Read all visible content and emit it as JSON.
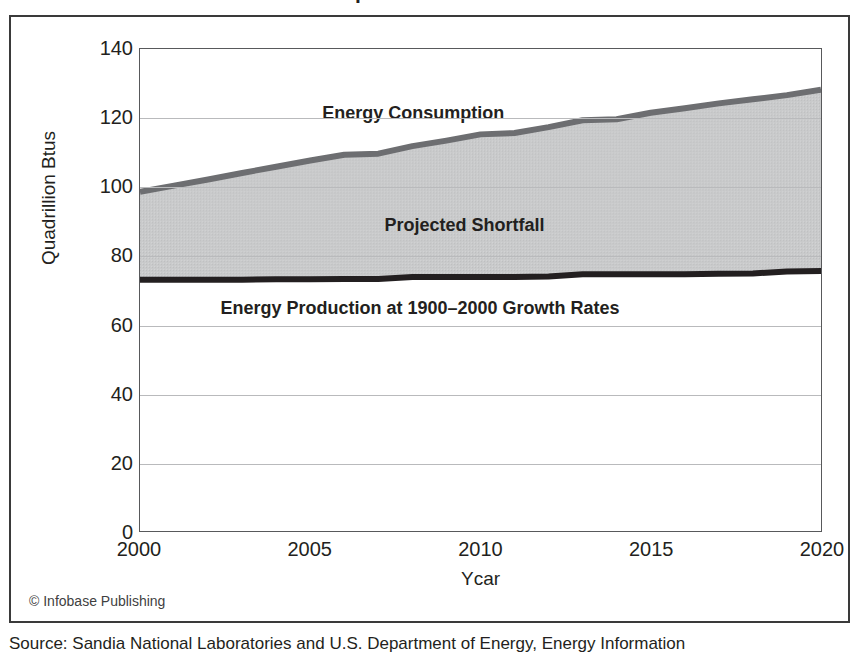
{
  "figure": {
    "title": "as Compared with Production",
    "credit": "© Infobase Publishing",
    "source": "Source: Sandia National Laboratories and U.S. Department of Energy, Energy Information"
  },
  "chart_data": {
    "type": "area",
    "title": "as Compared with Production",
    "xlabel": "Ycar",
    "ylabel": "Quadrillion Btus",
    "xlim": [
      2000,
      2020
    ],
    "ylim": [
      0,
      140
    ],
    "xticks": [
      "2000",
      "2005",
      "2010",
      "2015",
      "2020"
    ],
    "xtick_values": [
      2000,
      2005,
      2010,
      2015,
      2020
    ],
    "yticks": [
      "0",
      "20",
      "40",
      "60",
      "80",
      "100",
      "120",
      "140"
    ],
    "ytick_values": [
      0,
      20,
      40,
      60,
      80,
      100,
      120,
      140
    ],
    "grid": true,
    "legend_position": "in-plot annotations",
    "annotations": [
      {
        "text": "Energy Consumption",
        "x": 2008.0,
        "y": 121.5
      },
      {
        "text": "Projected Shortfall",
        "x": 2009.5,
        "y": 89.0
      },
      {
        "text": "Energy Production at 1900–2000 Growth Rates",
        "x": 2008.2,
        "y": 65.0
      }
    ],
    "x": [
      2000,
      2001,
      2002,
      2003,
      2004,
      2005,
      2006,
      2007,
      2008,
      2009,
      2010,
      2011,
      2012,
      2013,
      2014,
      2015,
      2016,
      2017,
      2018,
      2019,
      2020
    ],
    "series": [
      {
        "name": "Energy Consumption",
        "color": "#6d6e71",
        "values": [
          98.5,
          100.3,
          102.1,
          104.0,
          105.8,
          107.6,
          109.3,
          109.6,
          111.8,
          113.4,
          115.2,
          115.6,
          117.3,
          119.3,
          119.6,
          121.5,
          122.8,
          124.2,
          125.4,
          126.6,
          128.2
        ]
      },
      {
        "name": "Energy Production at 1900–2000 Growth Rates",
        "color": "#231f20",
        "values": [
          73.0,
          73.0,
          73.0,
          73.0,
          73.1,
          73.1,
          73.2,
          73.2,
          73.8,
          73.8,
          73.8,
          73.8,
          73.9,
          74.6,
          74.6,
          74.6,
          74.6,
          74.7,
          74.8,
          75.4,
          75.5
        ]
      }
    ],
    "shaded_band": {
      "name": "Projected Shortfall",
      "between": [
        "Energy Production at 1900–2000 Growth Rates",
        "Energy Consumption"
      ],
      "color": "#c8c9ca"
    }
  }
}
